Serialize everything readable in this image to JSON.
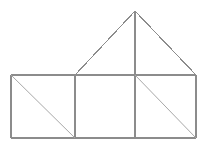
{
  "figure": {
    "background_color": "#ffffff",
    "stroke_color": "#8c8c8c",
    "diagonal_color": "#a8a8a8",
    "width": 207,
    "height": 149,
    "chart_data": {
      "type": "diagram",
      "title": "House figure composed of squares and triangles",
      "xlabel": "",
      "ylabel": "",
      "xlim": [
        0,
        207
      ],
      "ylim": [
        0,
        149
      ],
      "grid": false,
      "legend": "none",
      "points": {
        "A": [
          11,
          75
        ],
        "B": [
          75,
          75
        ],
        "C": [
          135,
          75
        ],
        "D": [
          196,
          75
        ],
        "E": [
          11,
          138
        ],
        "F": [
          75,
          138
        ],
        "G": [
          135,
          138
        ],
        "H": [
          196,
          138
        ],
        "P": [
          135,
          11
        ]
      },
      "shapes": [
        {
          "name": "left-square",
          "kind": "square",
          "vertices": [
            [
              11,
              75
            ],
            [
              75,
              75
            ],
            [
              75,
              138
            ],
            [
              11,
              138
            ]
          ],
          "has_diagonal": true,
          "diagonal": [
            [
              11,
              75
            ],
            [
              75,
              138
            ]
          ]
        },
        {
          "name": "middle-square",
          "kind": "square",
          "vertices": [
            [
              75,
              75
            ],
            [
              135,
              75
            ],
            [
              135,
              138
            ],
            [
              75,
              138
            ]
          ],
          "has_diagonal": false,
          "diagonal": null
        },
        {
          "name": "right-square",
          "kind": "square",
          "vertices": [
            [
              135,
              75
            ],
            [
              196,
              75
            ],
            [
              196,
              138
            ],
            [
              135,
              138
            ]
          ],
          "has_diagonal": true,
          "diagonal": [
            [
              135,
              75
            ],
            [
              196,
              138
            ]
          ]
        },
        {
          "name": "roof-triangle",
          "kind": "isosceles-triangle",
          "vertices": [
            [
              75,
              75
            ],
            [
              135,
              11
            ],
            [
              196,
              75
            ]
          ],
          "has_diagonal": true,
          "diagonal": [
            [
              135,
              11
            ],
            [
              135,
              75
            ]
          ]
        }
      ],
      "segments": [
        {
          "name": "outer-top-left-roof",
          "from": [
            75,
            75
          ],
          "to": [
            135,
            11
          ],
          "style": "solid"
        },
        {
          "name": "outer-top-right-roof",
          "from": [
            135,
            11
          ],
          "to": [
            196,
            75
          ],
          "style": "solid"
        },
        {
          "name": "base-line-top",
          "from": [
            11,
            75
          ],
          "to": [
            196,
            75
          ],
          "style": "solid"
        },
        {
          "name": "base-line-bottom",
          "from": [
            11,
            138
          ],
          "to": [
            196,
            138
          ],
          "style": "solid"
        },
        {
          "name": "left-edge",
          "from": [
            11,
            75
          ],
          "to": [
            11,
            138
          ],
          "style": "solid"
        },
        {
          "name": "right-edge",
          "from": [
            196,
            75
          ],
          "to": [
            196,
            138
          ],
          "style": "solid"
        },
        {
          "name": "vertical-divider-left",
          "from": [
            75,
            75
          ],
          "to": [
            75,
            138
          ],
          "style": "solid"
        },
        {
          "name": "vertical-center-axis",
          "from": [
            135,
            11
          ],
          "to": [
            135,
            138
          ],
          "style": "solid"
        },
        {
          "name": "diagonal-left-square",
          "from": [
            11,
            75
          ],
          "to": [
            75,
            138
          ],
          "style": "thin"
        },
        {
          "name": "diagonal-right-square",
          "from": [
            135,
            75
          ],
          "to": [
            196,
            138
          ],
          "style": "thin"
        }
      ]
    }
  }
}
